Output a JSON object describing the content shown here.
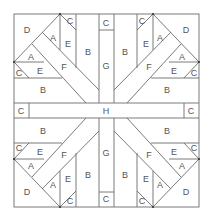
{
  "diagram": {
    "type": "quilt block piecing pattern",
    "line_color": "#6b6b6b",
    "label_color": "#555555",
    "pieces": {
      "A": "A",
      "B": "B",
      "C": "C",
      "D": "D",
      "E": "E",
      "F": "F",
      "G": "G",
      "H": "H"
    },
    "labels": [
      {
        "id": "tl-D",
        "text": "D"
      },
      {
        "id": "tl-A1",
        "text": "A"
      },
      {
        "id": "tl-C1",
        "text": "C"
      },
      {
        "id": "tl-E1",
        "text": "E"
      },
      {
        "id": "tl-B1",
        "text": "B"
      },
      {
        "id": "tl-A2",
        "text": "A"
      },
      {
        "id": "tl-E2",
        "text": "E"
      },
      {
        "id": "tl-F",
        "text": "F"
      },
      {
        "id": "tl-C2",
        "text": "C"
      },
      {
        "id": "tl-B2",
        "text": "B"
      },
      {
        "id": "top-C",
        "text": "C"
      },
      {
        "id": "top-G",
        "text": "G"
      },
      {
        "id": "tr-D",
        "text": "D"
      },
      {
        "id": "tr-A1",
        "text": "A"
      },
      {
        "id": "tr-C1",
        "text": "C"
      },
      {
        "id": "tr-E1",
        "text": "E"
      },
      {
        "id": "tr-B1",
        "text": "B"
      },
      {
        "id": "tr-A2",
        "text": "A"
      },
      {
        "id": "tr-E2",
        "text": "E"
      },
      {
        "id": "tr-F",
        "text": "F"
      },
      {
        "id": "tr-C2",
        "text": "C"
      },
      {
        "id": "tr-B2",
        "text": "B"
      },
      {
        "id": "left-C",
        "text": "C"
      },
      {
        "id": "center-H",
        "text": "H"
      },
      {
        "id": "right-C",
        "text": "C"
      },
      {
        "id": "bl-B2",
        "text": "B"
      },
      {
        "id": "bl-C2",
        "text": "C"
      },
      {
        "id": "bl-E2",
        "text": "E"
      },
      {
        "id": "bl-F",
        "text": "F"
      },
      {
        "id": "bl-A2",
        "text": "A"
      },
      {
        "id": "bl-D",
        "text": "D"
      },
      {
        "id": "bl-A1",
        "text": "A"
      },
      {
        "id": "bl-E1",
        "text": "E"
      },
      {
        "id": "bl-C1",
        "text": "C"
      },
      {
        "id": "bl-B1",
        "text": "B"
      },
      {
        "id": "bottom-G",
        "text": "G"
      },
      {
        "id": "bottom-C",
        "text": "C"
      },
      {
        "id": "br-B2",
        "text": "B"
      },
      {
        "id": "br-C2",
        "text": "C"
      },
      {
        "id": "br-E2",
        "text": "E"
      },
      {
        "id": "br-F",
        "text": "F"
      },
      {
        "id": "br-A2",
        "text": "A"
      },
      {
        "id": "br-D",
        "text": "D"
      },
      {
        "id": "br-A1",
        "text": "A"
      },
      {
        "id": "br-E1",
        "text": "E"
      },
      {
        "id": "br-C1",
        "text": "C"
      },
      {
        "id": "br-B1",
        "text": "B"
      }
    ]
  }
}
